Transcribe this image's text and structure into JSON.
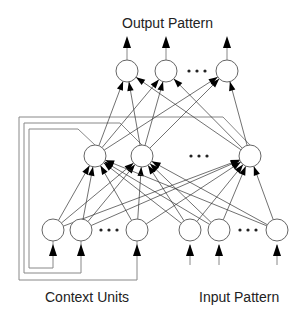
{
  "diagram": {
    "labels": {
      "output": "Output Pattern",
      "context": "Context Units",
      "input": "Input Pattern"
    },
    "ellipsis": "• • •",
    "layers": {
      "output": [
        {
          "x": 127,
          "y": 71
        },
        {
          "x": 166,
          "y": 71
        },
        {
          "x": 227,
          "y": 71
        }
      ],
      "hidden": [
        {
          "x": 95,
          "y": 156
        },
        {
          "x": 142,
          "y": 156
        },
        {
          "x": 250,
          "y": 156
        }
      ],
      "context": [
        {
          "x": 53,
          "y": 230
        },
        {
          "x": 81,
          "y": 230
        },
        {
          "x": 137,
          "y": 230
        }
      ],
      "input": [
        {
          "x": 190,
          "y": 230
        },
        {
          "x": 219,
          "y": 230
        },
        {
          "x": 277,
          "y": 230
        }
      ]
    },
    "node_radius": 11,
    "colors": {
      "node_stroke": "#666666",
      "edge": "#333333",
      "loop": "#888888",
      "arrow": "#000000"
    }
  }
}
